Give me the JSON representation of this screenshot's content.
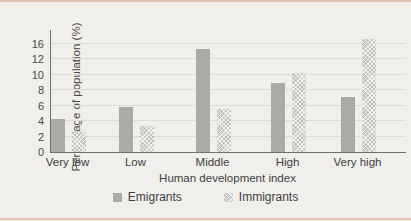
{
  "figure": {
    "background_color": "#f0efeb",
    "scan_stripe_color": "#df8f85",
    "axis_color": "#6e6e6e"
  },
  "chart_data": {
    "type": "bar",
    "title": "",
    "xlabel": "Human development index",
    "ylabel": "Percentage of population (%)",
    "categories": [
      "Very low",
      "Low",
      "Middle",
      "High",
      "Very high"
    ],
    "series": [
      {
        "name": "Emigrants",
        "pattern": "solid",
        "color": "#acaaa7",
        "values": [
          4.2,
          5.8,
          14.5,
          8.9,
          7.1
        ]
      },
      {
        "name": "Immigrants",
        "pattern": "checker",
        "color": "#c2c0bd",
        "values": [
          2.7,
          3.3,
          5.6,
          10.2,
          17.2
        ]
      }
    ],
    "y_ticks": [
      0,
      2,
      4,
      6,
      8,
      10,
      12,
      16
    ],
    "grid": true,
    "legend_position": "bottom"
  }
}
